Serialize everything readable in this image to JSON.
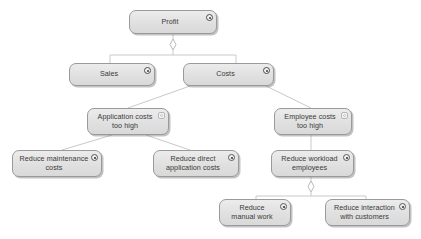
{
  "diagram": {
    "type": "archimate-motivation",
    "background_color": "#ffffff",
    "node_fill_color": "#e4e4e4",
    "node_border_color": "#9a9a9a",
    "edge_color": "#c9c9c9",
    "text_color": "#3a3a3a"
  },
  "nodes": [
    {
      "id": "profit",
      "label": "Profit",
      "icon": "gear-icon",
      "icon_class": "icon-gear",
      "x": 129,
      "y": 10,
      "w": 88,
      "h": 24
    },
    {
      "id": "sales",
      "label": "Sales",
      "icon": "gear-icon",
      "icon_class": "icon-gear",
      "x": 69,
      "y": 63,
      "w": 86,
      "h": 23
    },
    {
      "id": "costs",
      "label": "Costs",
      "icon": "gear-icon",
      "icon_class": "icon-gear",
      "x": 183,
      "y": 63,
      "w": 91,
      "h": 23
    },
    {
      "id": "application-costs-too-high",
      "label": "Application costs\ntoo high",
      "icon": "assessment-icon",
      "icon_class": "icon-assessment",
      "x": 87,
      "y": 108,
      "w": 82,
      "h": 27
    },
    {
      "id": "employee-costs-too-high",
      "label": "Employee costs\ntoo high",
      "icon": "assessment-icon",
      "icon_class": "icon-assessment",
      "x": 274,
      "y": 108,
      "w": 78,
      "h": 27
    },
    {
      "id": "reduce-maintenance-costs",
      "label": "Reduce maintenance\ncosts",
      "icon": "goal-icon",
      "icon_class": "icon-goal",
      "x": 12,
      "y": 150,
      "w": 90,
      "h": 27
    },
    {
      "id": "reduce-direct-application-costs",
      "label": "Reduce direct\napplication costs",
      "icon": "goal-icon",
      "icon_class": "icon-goal",
      "x": 153,
      "y": 150,
      "w": 86,
      "h": 27
    },
    {
      "id": "reduce-workload-employees",
      "label": "Reduce workload\nemployees",
      "icon": "goal-icon",
      "icon_class": "icon-goal",
      "x": 271,
      "y": 150,
      "w": 83,
      "h": 27
    },
    {
      "id": "reduce-manual-work",
      "label": "Reduce\nmanual work",
      "icon": "goal-icon",
      "icon_class": "icon-goal",
      "x": 219,
      "y": 199,
      "w": 72,
      "h": 27
    },
    {
      "id": "reduce-interaction-with-customers",
      "label": "Reduce interaction\nwith customers",
      "icon": "goal-icon",
      "icon_class": "icon-goal",
      "x": 325,
      "y": 199,
      "w": 85,
      "h": 27
    }
  ],
  "edges": [
    {
      "from": "profit",
      "to": "junction-1",
      "kind": "aggregation"
    },
    {
      "from": "junction-1",
      "to": "sales",
      "kind": "branch"
    },
    {
      "from": "junction-1",
      "to": "costs",
      "kind": "branch"
    },
    {
      "from": "costs",
      "to": "application-costs-too-high",
      "kind": "influence"
    },
    {
      "from": "costs",
      "to": "employee-costs-too-high",
      "kind": "influence"
    },
    {
      "from": "application-costs-too-high",
      "to": "reduce-maintenance-costs",
      "kind": "influence"
    },
    {
      "from": "application-costs-too-high",
      "to": "reduce-direct-application-costs",
      "kind": "influence"
    },
    {
      "from": "employee-costs-too-high",
      "to": "reduce-workload-employees",
      "kind": "influence"
    },
    {
      "from": "reduce-workload-employees",
      "to": "junction-2",
      "kind": "aggregation"
    },
    {
      "from": "junction-2",
      "to": "reduce-manual-work",
      "kind": "branch"
    },
    {
      "from": "junction-2",
      "to": "reduce-interaction-with-customers",
      "kind": "branch"
    }
  ]
}
